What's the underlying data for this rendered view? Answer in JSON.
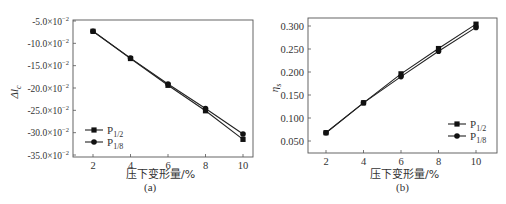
{
  "chart_data": [
    {
      "id": "a",
      "type": "line",
      "panel_label": "(a)",
      "title": "",
      "xlabel": "压下变形量/%",
      "ylabel": "Δl_c",
      "ylabel_main": "Δl",
      "ylabel_sub": "c",
      "x": [
        2,
        4,
        6,
        8,
        10
      ],
      "xticks": [
        "2",
        "4",
        "6",
        "8",
        "10"
      ],
      "yticks": [
        "-5.0×10⁻²",
        "-10.0×10⁻²",
        "-15.0×10⁻²",
        "-20.0×10⁻²",
        "-25.0×10⁻²",
        "-30.0×10⁻²",
        "-35.0×10⁻²"
      ],
      "ytick_values": [
        -5.0,
        -10.0,
        -15.0,
        -20.0,
        -25.0,
        -30.0,
        -35.0
      ],
      "ylim": [
        -35.0,
        -5.0
      ],
      "y_unit_multiplier": "×10⁻²",
      "legend_position": "lower left",
      "grid": false,
      "series": [
        {
          "name": "P1/2",
          "label_main": "P",
          "label_sub": "1/2",
          "marker": "square",
          "values": [
            -7.3,
            -13.4,
            -19.4,
            -25.1,
            -31.5
          ]
        },
        {
          "name": "P1/8",
          "label_main": "P",
          "label_sub": "1/8",
          "marker": "circle",
          "values": [
            -7.3,
            -13.3,
            -19.1,
            -24.6,
            -30.3
          ]
        }
      ]
    },
    {
      "id": "b",
      "type": "line",
      "panel_label": "(b)",
      "title": "",
      "xlabel": "压下变形量/%",
      "ylabel": "η_s",
      "ylabel_main": "η",
      "ylabel_sub": "s",
      "x": [
        2,
        4,
        6,
        8,
        10
      ],
      "xticks": [
        "2",
        "4",
        "6",
        "8",
        "10"
      ],
      "yticks": [
        "0.300",
        "0.250",
        "0.200",
        "0.150",
        "0.100",
        "0.050"
      ],
      "ytick_values": [
        0.3,
        0.25,
        0.2,
        0.15,
        0.1,
        0.05
      ],
      "ylim": [
        0.025,
        0.315
      ],
      "legend_position": "lower right",
      "grid": false,
      "series": [
        {
          "name": "P1/2",
          "label_main": "P",
          "label_sub": "1/2",
          "marker": "square",
          "values": [
            0.068,
            0.133,
            0.196,
            0.251,
            0.304
          ]
        },
        {
          "name": "P1/8",
          "label_main": "P",
          "label_sub": "1/8",
          "marker": "circle",
          "values": [
            0.068,
            0.133,
            0.19,
            0.245,
            0.297
          ]
        }
      ]
    }
  ]
}
